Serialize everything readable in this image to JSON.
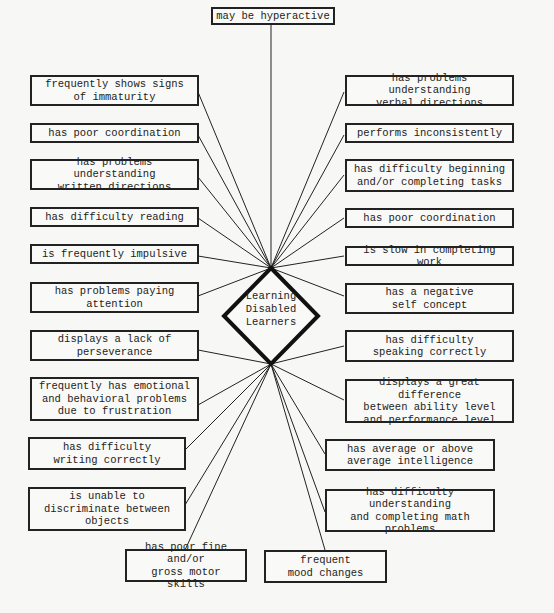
{
  "center": {
    "label": "Learning\nDisabled\nLearners"
  },
  "top": {
    "label": "may be hyperactive"
  },
  "left_items": [
    {
      "label": "frequently shows signs\nof immaturity"
    },
    {
      "label": "has poor coordination"
    },
    {
      "label": "has problems understanding\nwritten directions"
    },
    {
      "label": "has difficulty reading"
    },
    {
      "label": "is frequently impulsive"
    },
    {
      "label": "has problems paying\nattention"
    },
    {
      "label": "displays a lack of\nperseverance"
    },
    {
      "label": "frequently has emotional\nand behavioral problems\ndue to frustration"
    },
    {
      "label": "has difficulty\nwriting correctly"
    },
    {
      "label": "is unable to\ndiscriminate between\nobjects"
    }
  ],
  "right_items": [
    {
      "label": "has problems understanding\nverbal directions"
    },
    {
      "label": "performs inconsistently"
    },
    {
      "label": "has difficulty beginning\nand/or completing tasks"
    },
    {
      "label": "has poor coordination"
    },
    {
      "label": "is slow in completing work"
    },
    {
      "label": "has a negative\nself concept"
    },
    {
      "label": "has difficulty\nspeaking correctly"
    },
    {
      "label": "displays a great difference\nbetween ability level\nand performance level"
    },
    {
      "label": "has average or above\naverage intelligence"
    },
    {
      "label": "has difficulty understanding\nand completing math\nproblems"
    }
  ],
  "bottom_items": [
    {
      "label": "has poor fine and/or\ngross motor skills"
    },
    {
      "label": "frequent\nmood changes"
    }
  ]
}
